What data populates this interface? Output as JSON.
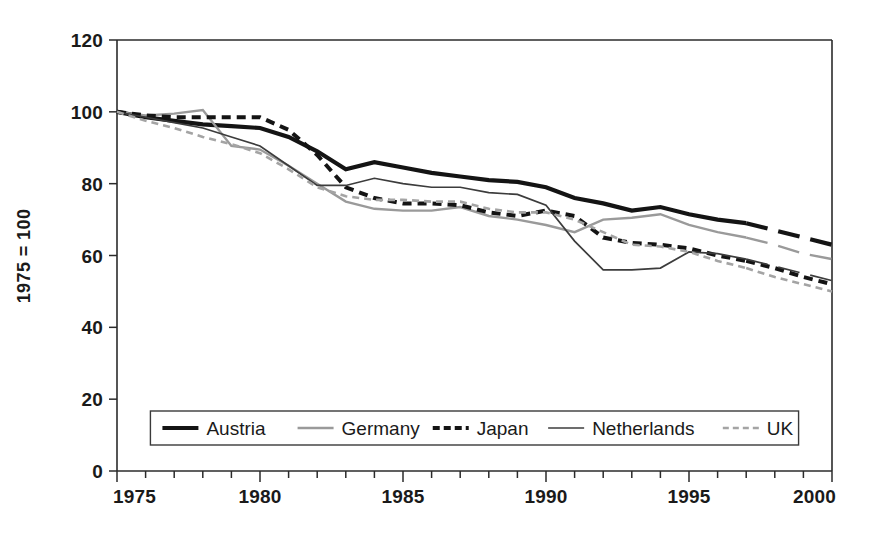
{
  "chart_data": {
    "type": "line",
    "title": "",
    "xlabel": "",
    "ylabel": "1975 = 100",
    "xlim": [
      1975,
      2000
    ],
    "ylim": [
      0,
      120
    ],
    "y_ticks": [
      0,
      20,
      40,
      60,
      80,
      100,
      120
    ],
    "y_tick_labels": [
      "0",
      "20",
      "40",
      "60",
      "80",
      "100",
      "120"
    ],
    "x_ticks": [
      1975,
      1976,
      1977,
      1978,
      1979,
      1980,
      1981,
      1982,
      1983,
      1984,
      1985,
      1986,
      1987,
      1988,
      1989,
      1990,
      1991,
      1992,
      1993,
      1994,
      1995,
      1996,
      1997,
      1998,
      1999,
      2000
    ],
    "x_tick_labels_shown": [
      "1975",
      "1980",
      "1985",
      "1990",
      "1995",
      "2000"
    ],
    "x_labelled_ticks": [
      1975,
      1980,
      1985,
      1990,
      1995,
      2000
    ],
    "grid": false,
    "legend_position": "bottom-center",
    "projection_starts_at": 1997,
    "x": [
      1975,
      1976,
      1977,
      1978,
      1979,
      1980,
      1981,
      1982,
      1983,
      1984,
      1985,
      1986,
      1987,
      1988,
      1989,
      1990,
      1991,
      1992,
      1993,
      1994,
      1995,
      1996,
      1997,
      1998,
      1999,
      2000
    ],
    "series": [
      {
        "name": "Austria",
        "color": "#141414",
        "width": 4.2,
        "style": "solid",
        "values": [
          100,
          98.5,
          97.5,
          96.5,
          96,
          95.5,
          93,
          89,
          84,
          86,
          84.5,
          83,
          82,
          81,
          80.5,
          79,
          76,
          74.5,
          72.5,
          73.5,
          71.5,
          70,
          69,
          67,
          65,
          63
        ]
      },
      {
        "name": "Germany",
        "color": "#9a9a9a",
        "width": 2.4,
        "style": "solid",
        "values": [
          100,
          99,
          99.5,
          100.5,
          90.5,
          89.5,
          85,
          80,
          75,
          73,
          72.5,
          72.5,
          73.5,
          71,
          70,
          68.5,
          66.5,
          70,
          70.5,
          71.5,
          68.5,
          66.5,
          65,
          63,
          60.5,
          59
        ]
      },
      {
        "name": "Japan",
        "color": "#141414",
        "width": 4.0,
        "style": "dashed",
        "dash": "9,6",
        "values": [
          100,
          99,
          98.5,
          98.5,
          98.5,
          98.5,
          95,
          88,
          79,
          76,
          74.5,
          74.5,
          74,
          72,
          71,
          72.5,
          71,
          65,
          63.5,
          63,
          62,
          60,
          58.5,
          56.5,
          54,
          52
        ]
      },
      {
        "name": "Netherlands",
        "color": "#3c3c3c",
        "width": 1.7,
        "style": "solid",
        "values": [
          100,
          98.5,
          97,
          95.5,
          93,
          90.5,
          85,
          79.5,
          79.5,
          81.5,
          80,
          79,
          79,
          77.5,
          77,
          74,
          64,
          56,
          56,
          56.5,
          61,
          60.5,
          59,
          57,
          55,
          53
        ]
      },
      {
        "name": "UK",
        "color": "#a4a4a4",
        "width": 2.6,
        "style": "dashed",
        "dash": "7,5",
        "values": [
          100,
          97.5,
          95.5,
          93,
          91,
          88.5,
          84,
          79,
          76.5,
          75.5,
          75.5,
          75,
          75,
          73,
          72,
          72,
          70,
          66.5,
          63,
          62.5,
          61,
          58.5,
          56.5,
          54,
          52,
          50
        ]
      }
    ],
    "legend": [
      {
        "label": "Austria",
        "color": "#141414",
        "style": "solid",
        "width": 4.2
      },
      {
        "label": "Germany",
        "color": "#9a9a9a",
        "style": "solid",
        "width": 2.4
      },
      {
        "label": "Japan",
        "color": "#141414",
        "style": "dashed",
        "width": 4.0,
        "dash": "7,4"
      },
      {
        "label": "Netherlands",
        "color": "#3c3c3c",
        "style": "solid",
        "width": 1.7
      },
      {
        "label": "UK",
        "color": "#a4a4a4",
        "style": "dashed",
        "width": 2.6,
        "dash": "6,4"
      }
    ]
  }
}
